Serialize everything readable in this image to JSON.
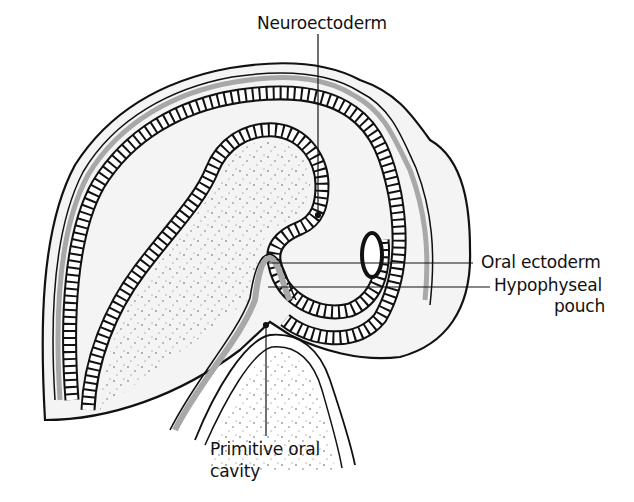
{
  "figure": {
    "type": "anatomical-diagram",
    "colors": {
      "background": "#ffffff",
      "outline": "#111111",
      "mesenchyme_fill": "#f4f4f4",
      "gray_layer": "#a8a8a8",
      "stipple": "#555555"
    }
  },
  "labels": {
    "neuroectoderm": "Neuroectoderm",
    "oral_ectoderm": "Oral ectoderm",
    "hypophyseal_line1": "Hypophyseal",
    "hypophyseal_line2": "pouch",
    "primitive_line1": "Primitive oral",
    "primitive_line2": "cavity"
  },
  "leader_lines": [
    {
      "label": "Neuroectoderm",
      "from": [
        318,
        34
      ],
      "to": [
        318,
        215
      ]
    },
    {
      "label": "Oral ectoderm",
      "from": [
        268,
        263
      ],
      "to": [
        473,
        263
      ]
    },
    {
      "label": "Hypophyseal pouch",
      "from": [
        268,
        287
      ],
      "to": [
        490,
        287
      ]
    },
    {
      "label": "Primitive oral cavity",
      "from": [
        266,
        325
      ],
      "to": [
        266,
        436
      ]
    }
  ]
}
